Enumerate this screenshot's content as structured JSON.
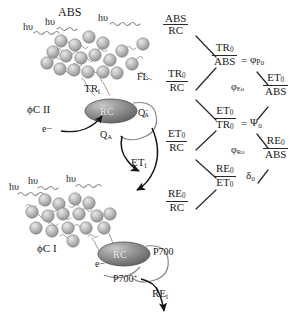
{
  "figure": {
    "background_color": "#ffffff",
    "ink_color": "#1b1b1b"
  },
  "psii": {
    "antenna_label": "ABS",
    "complex_label": "ϕC II",
    "photon_labels": [
      "hυ",
      "hυ",
      "hυ"
    ],
    "trapping_label": "TR",
    "trapping_sub": "t",
    "fluorescence_label": "FL",
    "reaction_center_label": "RC",
    "electron_label": "e−",
    "quinone_label": "Q",
    "quinone_sub": "A",
    "quinone_reduced_label": "Q",
    "quinone_reduced_sub": "A",
    "quinone_reduced_sup": "−"
  },
  "transport": {
    "electron_transport_label": "ET",
    "electron_transport_sub": "t"
  },
  "psi": {
    "complex_label": "ϕC I",
    "photon_labels": [
      "hυ",
      "hυ",
      "hυ"
    ],
    "reaction_center_label": "RC",
    "electron_label": "e−",
    "p700_label": "P700",
    "p700_oxidized_label": "P700",
    "p700_oxidized_sup": "+",
    "reduction_label": "RE",
    "reduction_sub": "t"
  },
  "flux_tree": {
    "specific_fluxes": [
      {
        "id": "abs-rc",
        "numerator": "ABS",
        "numerator_sub": "",
        "denominator": "RC",
        "denominator_sub": ""
      },
      {
        "id": "tr-rc",
        "numerator": "TR",
        "numerator_sub": "0",
        "denominator": "RC",
        "denominator_sub": ""
      },
      {
        "id": "et-rc",
        "numerator": "ET",
        "numerator_sub": "0",
        "denominator": "RC",
        "denominator_sub": ""
      },
      {
        "id": "re-rc",
        "numerator": "RE",
        "numerator_sub": "0",
        "denominator": "RC",
        "denominator_sub": ""
      }
    ],
    "yield_ratios": [
      {
        "id": "tr-abs",
        "numerator": "TR",
        "numerator_sub": "0",
        "denominator": "ABS",
        "denominator_sub": ""
      },
      {
        "id": "et-tr",
        "numerator": "ET",
        "numerator_sub": "0",
        "denominator": "TR",
        "denominator_sub": "0"
      },
      {
        "id": "re-et",
        "numerator": "RE",
        "numerator_sub": "0",
        "denominator": "ET",
        "denominator_sub": "0"
      }
    ],
    "phenomenological_ratios": [
      {
        "id": "et-abs",
        "numerator": "ET",
        "numerator_sub": "0",
        "denominator": "ABS",
        "denominator_sub": ""
      },
      {
        "id": "re-abs",
        "numerator": "RE",
        "numerator_sub": "0",
        "denominator": "ABS",
        "denominator_sub": ""
      }
    ],
    "equals_sign": "=",
    "quantum_yields": [
      {
        "id": "phi-po",
        "symbol": "φ",
        "sub": "Po"
      },
      {
        "id": "psi-o",
        "symbol": "Ψ",
        "sub": "o"
      },
      {
        "id": "phi-eo",
        "symbol": "φ",
        "sub": "Eo"
      },
      {
        "id": "phi-ro",
        "symbol": "φ",
        "sub": "Ro"
      },
      {
        "id": "delta-o",
        "symbol": "δ",
        "sub": "o"
      }
    ]
  }
}
